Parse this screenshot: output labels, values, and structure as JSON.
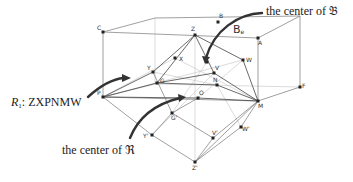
{
  "diagram": {
    "box_label": "B",
    "box_label_sub": "e",
    "points": {
      "C": "C",
      "B": "B",
      "A": "A",
      "Z": "Z",
      "X": "X",
      "W": "W",
      "V": "V",
      "N": "N",
      "Y": "Y",
      "G": "G",
      "P": "P",
      "O": "O",
      "M": "M",
      "F": "F",
      "G2": "G'",
      "Y2": "Y'",
      "V2": "V'",
      "W2": "W'",
      "Z2": "Z'"
    },
    "annotations": {
      "center_B": "the center of 𝔅",
      "region_R1": "R",
      "region_R1_sub": "1",
      "region_R1_text": ": ZXPNMW",
      "center_R": "the center of ℜ"
    }
  }
}
